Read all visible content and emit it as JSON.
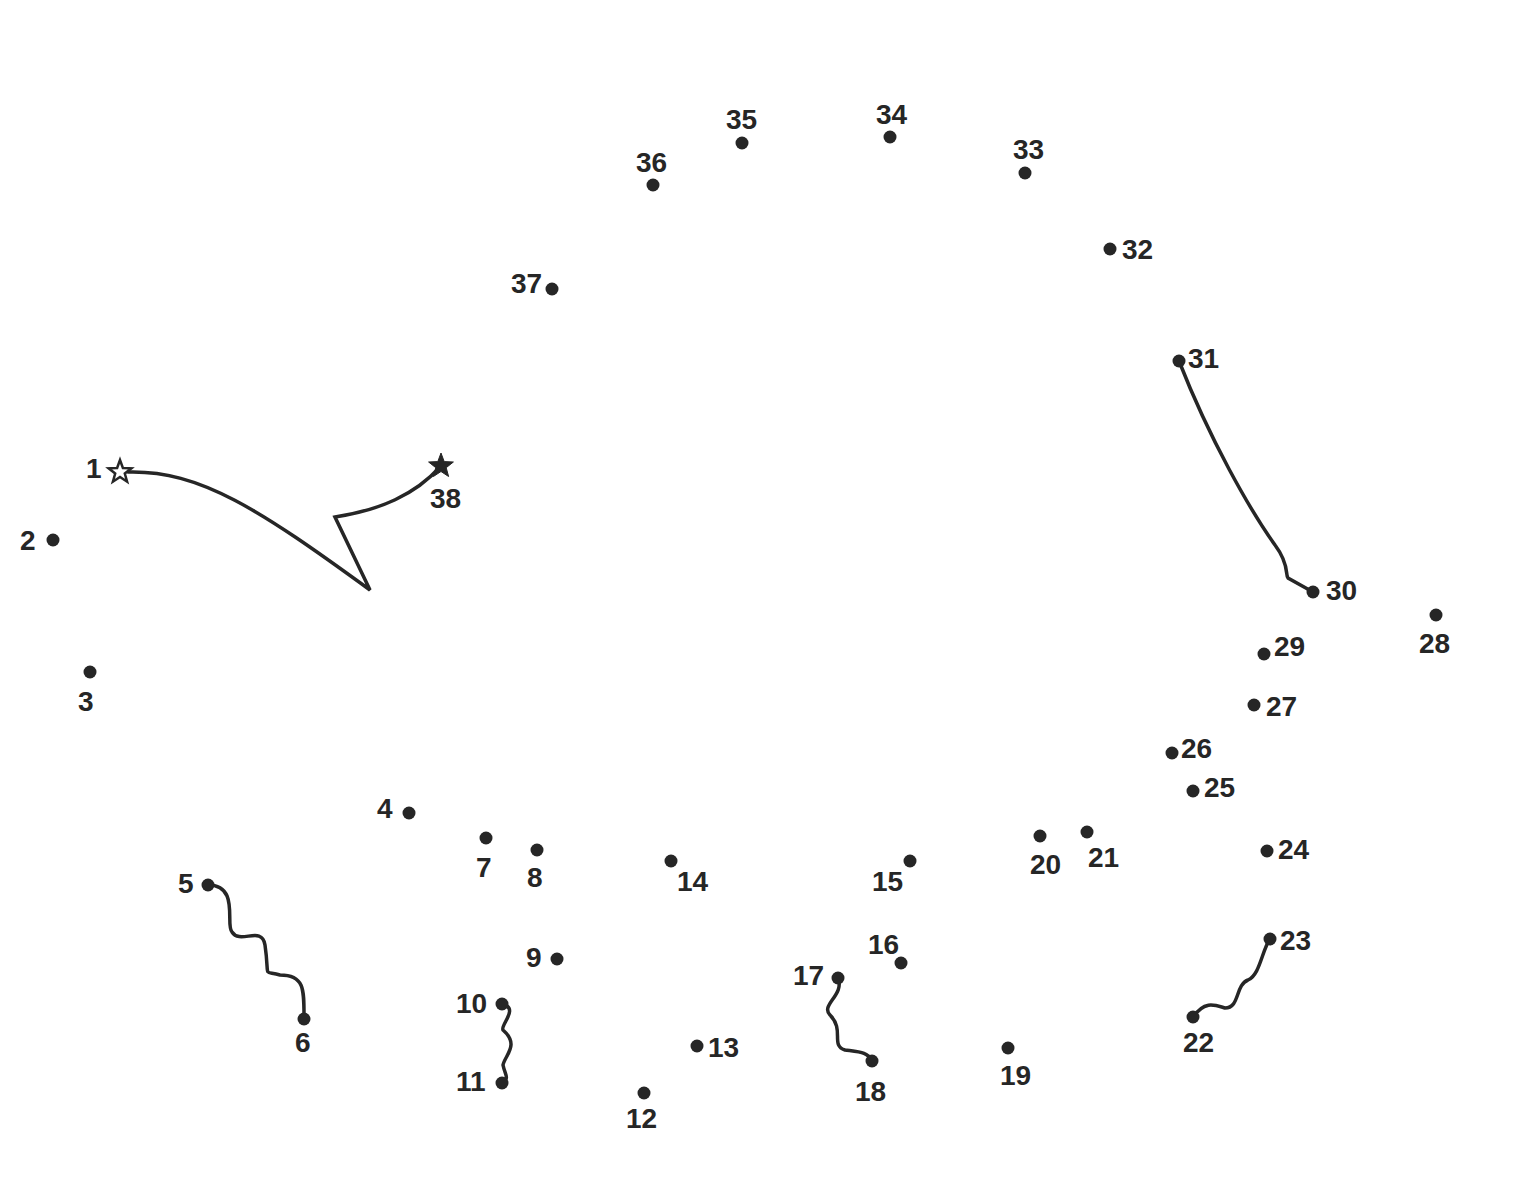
{
  "puzzle": {
    "type": "connect-the-dots",
    "ink_color": "#262626",
    "background": "#ffffff",
    "start": {
      "n": 1,
      "x": 120,
      "y": 472,
      "marker": "outline-star",
      "lx": 86,
      "ly": 478
    },
    "end": {
      "n": 38,
      "x": 441,
      "y": 466,
      "marker": "filled-star",
      "lx": 430,
      "ly": 508
    },
    "dots": [
      {
        "n": 2,
        "x": 53,
        "y": 540,
        "lx": 20,
        "ly": 550
      },
      {
        "n": 3,
        "x": 90,
        "y": 672,
        "lx": 78,
        "ly": 711
      },
      {
        "n": 4,
        "x": 409,
        "y": 813,
        "lx": 377,
        "ly": 818
      },
      {
        "n": 5,
        "x": 208,
        "y": 885,
        "lx": 178,
        "ly": 893
      },
      {
        "n": 6,
        "x": 304,
        "y": 1019,
        "lx": 295,
        "ly": 1052
      },
      {
        "n": 7,
        "x": 486,
        "y": 838,
        "lx": 476,
        "ly": 877
      },
      {
        "n": 8,
        "x": 537,
        "y": 850,
        "lx": 527,
        "ly": 887
      },
      {
        "n": 9,
        "x": 557,
        "y": 959,
        "lx": 526,
        "ly": 967
      },
      {
        "n": 10,
        "x": 502,
        "y": 1004,
        "lx": 456,
        "ly": 1013
      },
      {
        "n": 11,
        "x": 502,
        "y": 1083,
        "lx": 456,
        "ly": 1091
      },
      {
        "n": 12,
        "x": 644,
        "y": 1093,
        "lx": 626,
        "ly": 1128
      },
      {
        "n": 13,
        "x": 697,
        "y": 1046,
        "lx": 708,
        "ly": 1057
      },
      {
        "n": 14,
        "x": 671,
        "y": 861,
        "lx": 677,
        "ly": 891
      },
      {
        "n": 15,
        "x": 910,
        "y": 861,
        "lx": 872,
        "ly": 891
      },
      {
        "n": 16,
        "x": 901,
        "y": 963,
        "lx": 868,
        "ly": 954
      },
      {
        "n": 17,
        "x": 838,
        "y": 978,
        "lx": 793,
        "ly": 985
      },
      {
        "n": 18,
        "x": 872,
        "y": 1061,
        "lx": 855,
        "ly": 1101
      },
      {
        "n": 19,
        "x": 1008,
        "y": 1048,
        "lx": 1000,
        "ly": 1085
      },
      {
        "n": 20,
        "x": 1040,
        "y": 836,
        "lx": 1030,
        "ly": 874
      },
      {
        "n": 21,
        "x": 1087,
        "y": 832,
        "lx": 1088,
        "ly": 867
      },
      {
        "n": 22,
        "x": 1193,
        "y": 1017,
        "lx": 1183,
        "ly": 1052
      },
      {
        "n": 23,
        "x": 1270,
        "y": 939,
        "lx": 1280,
        "ly": 950
      },
      {
        "n": 24,
        "x": 1267,
        "y": 851,
        "lx": 1278,
        "ly": 859
      },
      {
        "n": 25,
        "x": 1193,
        "y": 791,
        "lx": 1204,
        "ly": 797
      },
      {
        "n": 26,
        "x": 1172,
        "y": 753,
        "lx": 1181,
        "ly": 758
      },
      {
        "n": 27,
        "x": 1254,
        "y": 705,
        "lx": 1266,
        "ly": 716
      },
      {
        "n": 28,
        "x": 1436,
        "y": 615,
        "lx": 1419,
        "ly": 653
      },
      {
        "n": 29,
        "x": 1264,
        "y": 654,
        "lx": 1274,
        "ly": 656
      },
      {
        "n": 30,
        "x": 1313,
        "y": 592,
        "lx": 1326,
        "ly": 600
      },
      {
        "n": 31,
        "x": 1179,
        "y": 361,
        "lx": 1188,
        "ly": 368
      },
      {
        "n": 32,
        "x": 1110,
        "y": 249,
        "lx": 1122,
        "ly": 259
      },
      {
        "n": 33,
        "x": 1025,
        "y": 173,
        "lx": 1013,
        "ly": 159
      },
      {
        "n": 34,
        "x": 890,
        "y": 137,
        "lx": 876,
        "ly": 124
      },
      {
        "n": 35,
        "x": 742,
        "y": 143,
        "lx": 726,
        "ly": 129
      },
      {
        "n": 36,
        "x": 653,
        "y": 185,
        "lx": 636,
        "ly": 172
      },
      {
        "n": 37,
        "x": 552,
        "y": 289,
        "lx": 511,
        "ly": 293
      }
    ],
    "drawn_segments": [
      {
        "name": "start-end-connector",
        "d": "M 128 472 C 200 470, 260 510, 370 590 L 335 517 C 380 510, 415 495, 441 466"
      },
      {
        "name": "segment-5-6",
        "d": "M 208 885 C 240 885, 225 925, 232 932 C 240 945, 262 925, 265 945 C 270 980, 262 970, 280 975 C 305 975, 304 990, 304 1019"
      },
      {
        "name": "segment-10-11",
        "d": "M 502 1004 C 520 1008, 500 1025, 503 1030 C 520 1045, 505 1055, 503 1065 C 505 1075, 510 1078, 502 1083"
      },
      {
        "name": "segment-17-18",
        "d": "M 838 978 C 845 995, 820 1005, 830 1015 C 845 1030, 830 1045, 845 1050 C 860 1052, 868 1052, 872 1061"
      },
      {
        "name": "segment-22-23",
        "d": "M 1193 1017 C 1205 1000, 1215 1005, 1225 1008 C 1240 1008, 1235 985, 1248 980 C 1260 975, 1262 950, 1270 939"
      },
      {
        "name": "segment-30-31",
        "d": "M 1179 361 C 1210 440, 1250 510, 1275 545 C 1290 565, 1285 575, 1288 578 L 1313 592"
      }
    ]
  }
}
